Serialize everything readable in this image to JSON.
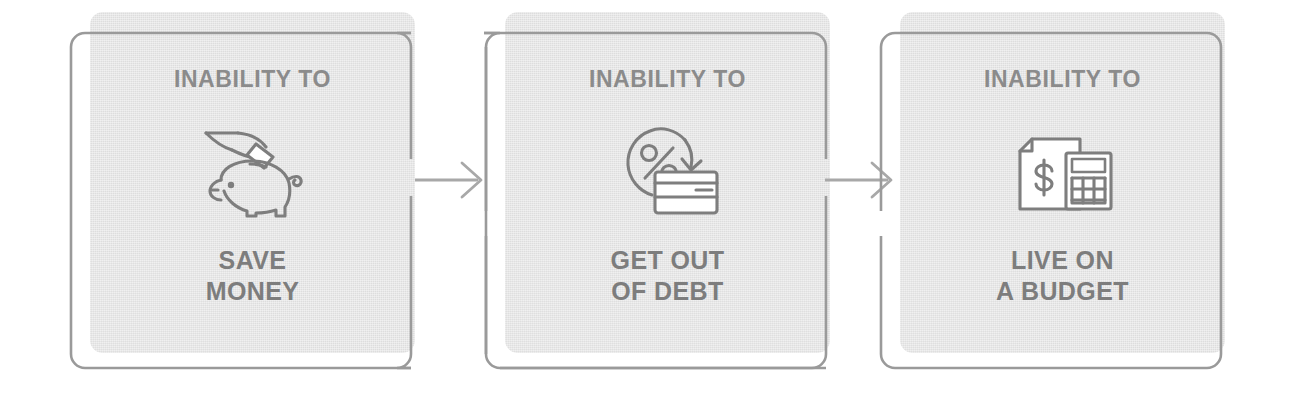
{
  "diagram": {
    "kind": "three-step-flow",
    "orientation": "horizontal",
    "palette": {
      "card_fill": "#e4e4e4",
      "outline_stroke": "#9a9a9a",
      "icon_stroke": "#7e7e7e",
      "kicker_text": "#8b8b8b",
      "title_text": "#7d7d7d",
      "page_background": "#ffffff",
      "arrow_stroke": "#a8a8a8"
    },
    "cards": [
      {
        "kicker": "INABILITY TO",
        "title_line1": "SAVE",
        "title_line2": "MONEY",
        "icon": "piggy-bank-with-hand-coin-icon"
      },
      {
        "kicker": "INABILITY TO",
        "title_line1": "GET OUT",
        "title_line2": "OF DEBT",
        "icon": "percent-arrow-credit-card-icon"
      },
      {
        "kicker": "INABILITY TO",
        "title_line1": "LIVE ON",
        "title_line2": "A BUDGET",
        "icon": "document-dollar-calculator-icon"
      }
    ],
    "connectors": [
      {
        "from": "card-1",
        "to": "card-2",
        "icon": "arrow-right-icon"
      },
      {
        "from": "card-2",
        "to": "card-3",
        "icon": "arrow-right-icon"
      }
    ]
  }
}
